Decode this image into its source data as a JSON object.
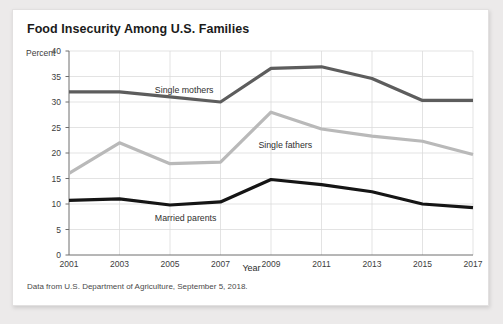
{
  "card": {
    "title": "Food Insecurity Among U.S. Families",
    "source": "Data from U.S. Department of Agriculture, September 5, 2018."
  },
  "chart_data": {
    "type": "line",
    "title": "Food Insecurity Among U.S. Families",
    "xlabel": "Year",
    "ylabel": "Percent",
    "ylim": [
      0,
      40
    ],
    "xlim": [
      2001,
      2017
    ],
    "yticks": [
      "0",
      "5",
      "10",
      "15",
      "20",
      "25",
      "30",
      "35",
      "40"
    ],
    "ytick_values": [
      0,
      5,
      10,
      15,
      20,
      25,
      30,
      35,
      40
    ],
    "categories": [
      2001,
      2003,
      2005,
      2007,
      2009,
      2011,
      2013,
      2015,
      2017
    ],
    "xtick_labels": [
      "2001",
      "2003",
      "2005",
      "2007",
      "2009",
      "2011",
      "2013",
      "2015",
      "2017"
    ],
    "grid": true,
    "legend": "inline-labels",
    "series": [
      {
        "name": "Single mothers",
        "color": "#5d5d5d",
        "values": [
          32.0,
          32.0,
          31.0,
          30.0,
          36.6,
          36.9,
          34.6,
          30.3,
          30.3
        ],
        "label_x": 2004.4,
        "label_y": 33.4
      },
      {
        "name": "Single fathers",
        "color": "#b9b9b9",
        "values": [
          16.0,
          22.0,
          17.9,
          18.2,
          28.0,
          24.7,
          23.3,
          22.3,
          19.7
        ],
        "label_x": 2008.5,
        "label_y": 22.6
      },
      {
        "name": "Married parents",
        "color": "#151515",
        "values": [
          10.7,
          11.0,
          9.8,
          10.4,
          14.8,
          13.8,
          12.4,
          10.0,
          9.3
        ],
        "label_x": 2004.4,
        "label_y": 8.2
      }
    ]
  }
}
